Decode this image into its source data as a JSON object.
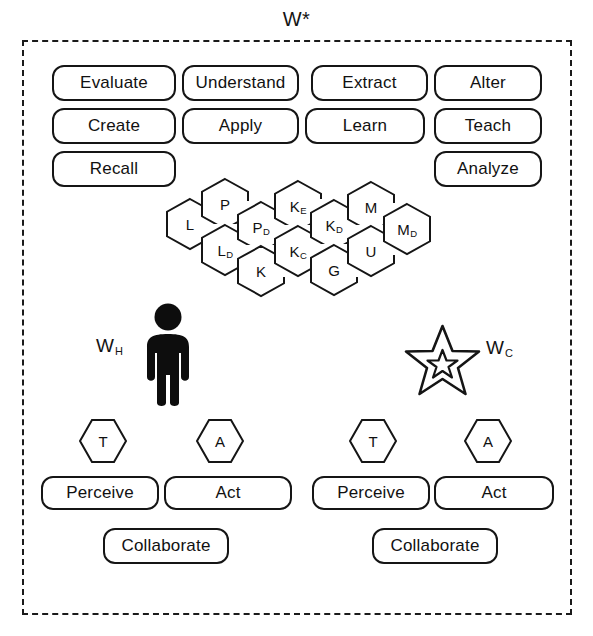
{
  "diagram": {
    "title": "W*",
    "boundary_name": "world-boundary"
  },
  "capabilities": {
    "row1": [
      {
        "label": "Evaluate"
      },
      {
        "label": "Understand"
      },
      {
        "label": "Extract"
      },
      {
        "label": "Alter"
      }
    ],
    "row2": [
      {
        "label": "Create"
      },
      {
        "label": "Apply"
      },
      {
        "label": "Learn"
      },
      {
        "label": "Teach"
      }
    ],
    "row3": [
      {
        "label": "Recall"
      },
      {
        "label": "Analyze"
      }
    ]
  },
  "knowledge_hexes": [
    {
      "base": "L",
      "sub": ""
    },
    {
      "base": "P",
      "sub": ""
    },
    {
      "base": "L",
      "sub": "D"
    },
    {
      "base": "P",
      "sub": "D"
    },
    {
      "base": "K",
      "sub": ""
    },
    {
      "base": "K",
      "sub": "E"
    },
    {
      "base": "K",
      "sub": "C"
    },
    {
      "base": "K",
      "sub": "D"
    },
    {
      "base": "G",
      "sub": ""
    },
    {
      "base": "M",
      "sub": ""
    },
    {
      "base": "U",
      "sub": ""
    },
    {
      "base": "M",
      "sub": "D"
    }
  ],
  "agents": {
    "human": {
      "label_base": "W",
      "label_sub": "H",
      "icon": "human-figure-icon",
      "markers": [
        {
          "label": "T"
        },
        {
          "label": "A"
        }
      ],
      "actions": [
        {
          "label": "Perceive"
        },
        {
          "label": "Act"
        },
        {
          "label": "Collaborate"
        }
      ]
    },
    "computer": {
      "label_base": "W",
      "label_sub": "C",
      "icon": "star-figure-icon",
      "markers": [
        {
          "label": "T"
        },
        {
          "label": "A"
        }
      ],
      "actions": [
        {
          "label": "Perceive"
        },
        {
          "label": "Act"
        },
        {
          "label": "Collaborate"
        }
      ]
    }
  },
  "colors": {
    "stroke": "#151515",
    "background": "#ffffff",
    "figure_fill": "#0d0d0d"
  }
}
